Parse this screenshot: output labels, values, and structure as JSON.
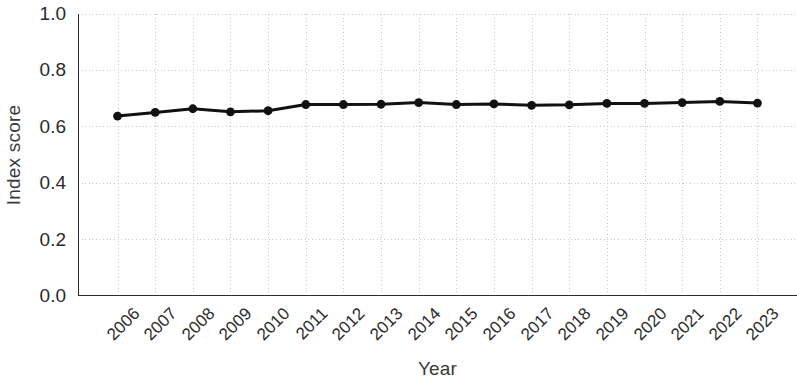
{
  "chart_data": {
    "type": "line",
    "title": "",
    "xlabel": "Year",
    "ylabel": "Index score",
    "categories": [
      "2006",
      "2007",
      "2008",
      "2009",
      "2010",
      "2011",
      "2012",
      "2013",
      "2014",
      "2015",
      "2016",
      "2017",
      "2018",
      "2019",
      "2020",
      "2021",
      "2022",
      "2023"
    ],
    "values": [
      0.638,
      0.651,
      0.664,
      0.653,
      0.657,
      0.679,
      0.679,
      0.68,
      0.686,
      0.679,
      0.681,
      0.676,
      0.678,
      0.683,
      0.683,
      0.686,
      0.69,
      0.684
    ],
    "ylim": [
      0.0,
      1.0
    ],
    "yticks": [
      "0.0",
      "0.2",
      "0.4",
      "0.6",
      "0.8",
      "1.0"
    ],
    "ytick_values": [
      0.0,
      0.2,
      0.4,
      0.6,
      0.8,
      1.0
    ],
    "grid": true,
    "grid_style": "dotted",
    "grid_color": "#c8c8c8",
    "legend": "none",
    "series_color": "#111111",
    "marker": "circle",
    "marker_size": 6,
    "line_width": 3,
    "xtick_rotation": -45
  }
}
